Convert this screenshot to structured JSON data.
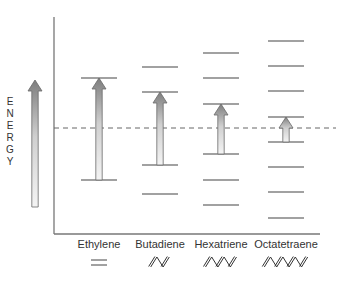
{
  "diagram": {
    "title": "",
    "axis_label": "ENERGY",
    "axis_letters": [
      "E",
      "N",
      "E",
      "R",
      "G",
      "Y"
    ],
    "reference_line": "dashed",
    "colors": {
      "line": "#444444",
      "axis": "#777777",
      "dash": "#666666",
      "arrow_dark": "#8a8a8a",
      "arrow_light": "#f2f2f2"
    },
    "molecules": [
      {
        "name": "Ethylene",
        "structure_glyph": "=",
        "center_x": 99,
        "levels_y": [
          78,
          180
        ],
        "transition": {
          "from_y": 180,
          "to_y": 78
        }
      },
      {
        "name": "Butadiene",
        "structure_glyph": "zigzag-2-double-bonds",
        "center_x": 160,
        "levels_y": [
          67,
          92,
          165,
          194
        ],
        "transition": {
          "from_y": 165,
          "to_y": 92
        }
      },
      {
        "name": "Hexatriene",
        "structure_glyph": "zigzag-3-double-bonds",
        "center_x": 221,
        "levels_y": [
          53,
          78,
          104,
          154,
          180,
          205
        ],
        "transition": {
          "from_y": 154,
          "to_y": 104
        }
      },
      {
        "name": "Octatetraene",
        "structure_glyph": "zigzag-4-double-bonds",
        "center_x": 286,
        "levels_y": [
          41,
          66,
          91,
          117,
          142,
          167,
          192,
          218
        ],
        "transition": {
          "from_y": 142,
          "to_y": 117
        }
      }
    ]
  }
}
